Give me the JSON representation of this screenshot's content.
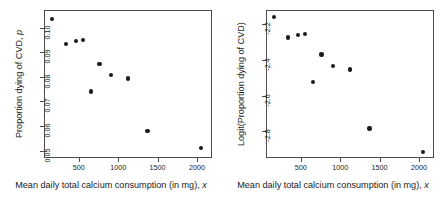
{
  "chart_data": [
    {
      "type": "scatter",
      "panel": "left",
      "title": "",
      "xlabel": "Mean daily total calcium consumption (in mg), x",
      "ylabel": "Proportion dying of CVD, p",
      "ylabel_main": "Proportion dying of CVD, ",
      "ylabel_italic": "p",
      "xlabel_main": "Mean daily total calcium consumption (in mg), ",
      "xlabel_italic": "x",
      "x": [
        150,
        325,
        450,
        545,
        645,
        750,
        900,
        1110,
        1360,
        2040
      ],
      "values": [
        0.104,
        0.0937,
        0.095,
        0.0953,
        0.0745,
        0.0856,
        0.0811,
        0.0797,
        0.0585,
        0.0515
      ],
      "xticks": [
        500,
        1000,
        1500,
        2000
      ],
      "xtick_labels": [
        "500",
        "1000",
        "1500",
        "2000"
      ],
      "yticks": [
        0.05,
        0.06,
        0.07,
        0.08,
        0.09,
        0.1
      ],
      "ytick_labels": [
        "0.05",
        "0.06",
        "0.07",
        "0.08",
        "0.09",
        "0.10"
      ],
      "xlim": [
        60,
        2190
      ],
      "ylim": [
        0.047,
        0.1072
      ],
      "grid": false,
      "legend": "none",
      "marker": "filled-circle",
      "marker_color": "#1a1a1a"
    },
    {
      "type": "scatter",
      "panel": "right",
      "title": "",
      "xlabel": "Mean daily total calcium consumption (in mg), x",
      "ylabel": "Logit(Proportion dying of CVD)",
      "ylabel_main": "Logit(Proportion dying of CVD)",
      "ylabel_italic": "",
      "xlabel_main": "Mean daily total calcium consumption (in mg), ",
      "xlabel_italic": "x",
      "x": [
        150,
        325,
        450,
        545,
        645,
        750,
        900,
        1110,
        1360,
        2040
      ],
      "values": [
        -2.153,
        -2.269,
        -2.254,
        -2.25,
        -2.519,
        -2.365,
        -2.428,
        -2.447,
        -2.779,
        -2.912
      ],
      "xticks": [
        500,
        1000,
        1500,
        2000
      ],
      "xtick_labels": [
        "500",
        "1000",
        "1500",
        "2000"
      ],
      "yticks": [
        -2.2,
        -2.4,
        -2.6,
        -2.8
      ],
      "ytick_labels": [
        "-2.2",
        "-2.4",
        "-2.6",
        "-2.8"
      ],
      "xlim": [
        60,
        2190
      ],
      "ylim": [
        -2.95,
        -2.12
      ],
      "grid": false,
      "legend": "none",
      "marker": "filled-circle",
      "marker_color": "#1a1a1a"
    }
  ]
}
